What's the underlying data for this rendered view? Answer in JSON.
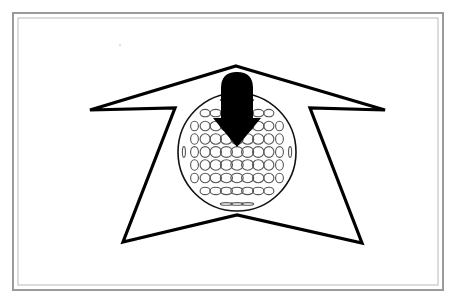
{
  "canvas": {
    "width": 463,
    "height": 308,
    "background_color": "#ffffff"
  },
  "frame": {
    "name": "double-line-rectangular-border",
    "outer": {
      "x": 13,
      "y": 13,
      "width": 430,
      "height": 277
    },
    "inner": {
      "x": 18,
      "y": 18,
      "width": 420,
      "height": 267
    },
    "outer_stroke_color": "#9a9a9a",
    "inner_stroke_color": "#b9b9b9",
    "outer_stroke_width": 2,
    "inner_stroke_width": 1,
    "fill": "#ffffff"
  },
  "figure": {
    "stroke_color": "#000000",
    "fill_color": "#ffffff",
    "accent_color": "#000000"
  },
  "star": {
    "name": "star-burst-outline",
    "stroke_width": 3.2,
    "fill": "#ffffff",
    "stroke": "#000000",
    "points": [
      [
        236,
        66
      ],
      [
        385,
        110
      ],
      [
        310,
        108
      ],
      [
        362,
        243
      ],
      [
        237,
        215
      ],
      [
        123,
        242
      ],
      [
        175,
        108
      ],
      [
        90,
        110
      ]
    ]
  },
  "ball": {
    "name": "golf-ball",
    "center_x": 237,
    "center_y": 152,
    "radius": 59,
    "stroke": "#111111",
    "stroke_width": 1.6,
    "fill": "#ffffff",
    "dimple": {
      "stroke": "#555555",
      "stroke_width": 1.1,
      "fill": "none",
      "columns": 11,
      "rows": 9,
      "max_rx": 6.2,
      "max_ry": 5.4
    }
  },
  "arrow": {
    "name": "down-arrow",
    "fill": "#000000",
    "tip_x": 237,
    "tip_y": 147,
    "top_y": 72,
    "shaft_half_width": 16,
    "head_half_width": 24,
    "head_top_y": 118,
    "cap_radius": 16
  },
  "speck": {
    "name": "dust-speck-artifact",
    "x": 120,
    "y": 45,
    "radius": 1.1,
    "color": "#d8d8d8"
  }
}
